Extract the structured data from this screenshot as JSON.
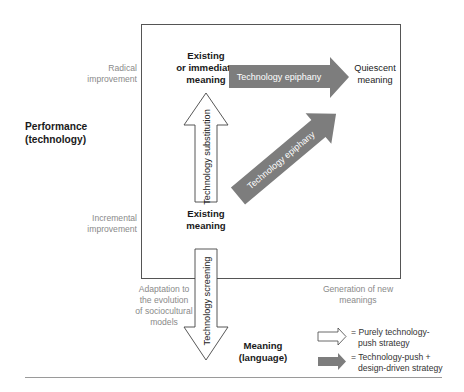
{
  "y_axis": {
    "title_line1": "Performance",
    "title_line2": "(technology)",
    "top_label_line1": "Radical",
    "top_label_line2": "improvement",
    "bottom_label_line1": "Incremental",
    "bottom_label_line2": "improvement"
  },
  "x_axis": {
    "title_line1": "Meaning",
    "title_line2": "(language)",
    "left_label_line1": "Adaptation to",
    "left_label_line2": "the evolution",
    "left_label_line3": "of sociocultural",
    "left_label_line4": "models",
    "right_label_line1": "Generation of new",
    "right_label_line2": "meanings"
  },
  "nodes": {
    "top_left_line1": "Existing",
    "top_left_line2": "or immediate",
    "top_left_line3": "meaning",
    "top_right_line1": "Quiescent",
    "top_right_line2": "meaning",
    "bottom_left_line1": "Existing",
    "bottom_left_line2": "meaning"
  },
  "arrows": {
    "horizontal_label": "Technology epiphany",
    "diagonal_label": "Technology epiphany",
    "vertical_up_label": "Technology substitution",
    "vertical_down_label": "Technology screening"
  },
  "legend": {
    "white_line1": "= Purely technology-",
    "white_line2": "push strategy",
    "gray_line1": "= Technology-push +",
    "gray_line2": "design-driven strategy"
  },
  "colors": {
    "gray_arrow": "#7d7d7d",
    "frame": "#555555",
    "rule": "#9a9a9a"
  }
}
